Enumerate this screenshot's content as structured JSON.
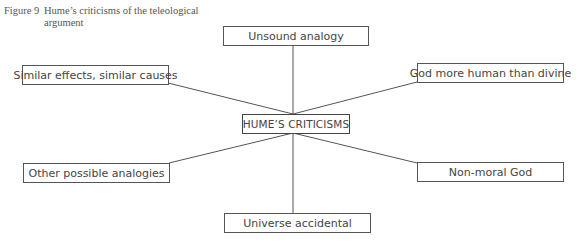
{
  "caption": {
    "figure_number": "Figure 9",
    "line1": "Hume’s criticisms of the teleological",
    "line2": "argument"
  },
  "diagram": {
    "center": "HUME’S CRITICISMS",
    "nodes": [
      {
        "id": "top",
        "label": "Unsound analogy"
      },
      {
        "id": "upper-left",
        "label": "Similar effects, similar causes"
      },
      {
        "id": "upper-right",
        "label": "God more human than divine"
      },
      {
        "id": "lower-left",
        "label": "Other possible analogies"
      },
      {
        "id": "lower-right",
        "label": "Non-moral God"
      },
      {
        "id": "bottom",
        "label": "Universe accidental"
      }
    ],
    "line_color": "#555555",
    "border_color": "#555555"
  }
}
